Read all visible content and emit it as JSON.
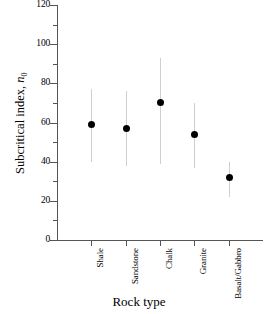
{
  "chart_data": {
    "type": "scatter",
    "title": "",
    "xlabel": "Rock type",
    "ylabel": "Subcritical index, n0",
    "ylabel_base": "Subcritical index, ",
    "ylabel_symbol": "n",
    "ylabel_subscript": "0",
    "categories": [
      "Shale",
      "Sandstone",
      "Chalk",
      "Granite",
      "Basalt/Gabbro"
    ],
    "values": [
      59,
      57,
      70,
      54,
      32
    ],
    "error_low": [
      40,
      38,
      39,
      37,
      22
    ],
    "error_high": [
      77,
      76,
      93,
      70,
      40
    ],
    "ylim": [
      0,
      120
    ],
    "yticks": [
      0,
      20,
      40,
      60,
      80,
      100,
      120
    ],
    "ytick_labels": [
      "0",
      "20",
      "40",
      "60",
      "80",
      "100",
      "120"
    ],
    "yminor_step": 10,
    "grid": false,
    "legend": false,
    "marker_color": "#000000",
    "errorbar_color": "#cfcfcf",
    "axis_color": "#555555"
  }
}
